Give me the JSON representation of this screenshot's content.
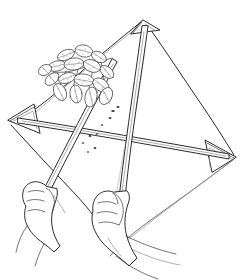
{
  "illustration": {
    "title": "Beating sheet with leafy branch and two hands",
    "medium": "black-and-white line drawing",
    "background_color": "#ffffff",
    "ink_color": "#2b2b2b",
    "secondary_ink_color": "#8d8d8d",
    "has_visible_text": false,
    "caption": ""
  },
  "scene": {
    "subject": "person holding a diamond-shaped beating sheet under a plant branch",
    "parts": [
      {
        "name": "beating-sheet",
        "label": "beating sheet",
        "shape": "diamond / kite"
      },
      {
        "name": "cross-stick",
        "label": "horizontal cross stick"
      },
      {
        "name": "frame-stick",
        "label": "vertical frame stick"
      },
      {
        "name": "beating-stick",
        "label": "beating stick"
      },
      {
        "name": "plant-branch",
        "label": "leafy branch"
      },
      {
        "name": "left-hand",
        "label": "left hand"
      },
      {
        "name": "right-hand",
        "label": "right hand"
      },
      {
        "name": "fallen-specks",
        "label": "dislodged insects on sheet"
      }
    ]
  },
  "sheet": {
    "name": "beating-sheet",
    "vertices": {
      "top": [
        143,
        20
      ],
      "left": [
        8,
        120
      ],
      "right": [
        236,
        157
      ],
      "bottom": [
        110,
        258
      ]
    },
    "corner_pockets": [
      "left",
      "right",
      "top"
    ],
    "fill": "#ffffff",
    "outline": "#2b2b2b"
  },
  "sticks": {
    "frame_stick": {
      "name": "frame-stick",
      "from": [
        145,
        26
      ],
      "to": [
        116,
        196
      ],
      "width_px": 5,
      "description": "runs from top apex down to the right hand"
    },
    "cross_stick": {
      "name": "cross-stick",
      "from": [
        18,
        120
      ],
      "to": [
        230,
        157
      ],
      "width_px": 4,
      "description": "spans left corner pocket to right corner pocket"
    },
    "beating_stick": {
      "name": "beating-stick",
      "from": [
        111,
        61
      ],
      "to": [
        44,
        190
      ],
      "width_px": 5,
      "description": "angled stick held in the left hand used to tap the branch"
    }
  },
  "branch": {
    "name": "plant-branch",
    "stem_from": [
      110,
      62
    ],
    "stem_to": [
      55,
      72
    ],
    "leaf_count": 17,
    "leaf_style": "stippled ovate leaves with midrib",
    "cluster_center": [
      82,
      78
    ]
  },
  "hands": {
    "left": {
      "name": "left-hand",
      "grip_point": [
        44,
        190
      ],
      "pose": "closed fist gripping beating stick",
      "wrist_exit": "bottom-left"
    },
    "right": {
      "name": "right-hand",
      "grip_point": [
        116,
        196
      ],
      "pose": "closed fist gripping frame stick",
      "wrist_exit": "bottom"
    }
  },
  "specks": {
    "name": "fallen-specks",
    "count": 9,
    "color": "#3d3d3d",
    "points": [
      [
        113,
        111
      ],
      [
        110,
        117
      ],
      [
        90,
        136
      ],
      [
        97,
        134
      ],
      [
        95,
        148
      ],
      [
        83,
        143
      ],
      [
        102,
        125
      ],
      [
        118,
        107
      ],
      [
        88,
        152
      ]
    ]
  }
}
